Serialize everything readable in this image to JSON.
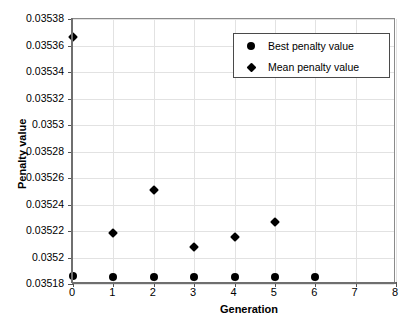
{
  "chart_data": {
    "type": "scatter",
    "title": "",
    "xlabel": "Generation",
    "ylabel": "Penalty value",
    "xlim": [
      0,
      8
    ],
    "ylim": [
      0.03518,
      0.03538
    ],
    "grid": true,
    "legend_position": "upper right",
    "xticks": [
      "0",
      "1",
      "2",
      "3",
      "4",
      "5",
      "6",
      "7",
      "8"
    ],
    "xtick_values": [
      0,
      1,
      2,
      3,
      4,
      5,
      6,
      7,
      8
    ],
    "yticks": [
      "0.03518",
      "0.0352",
      "0.03522",
      "0.03524",
      "0.03526",
      "0.03528",
      "0.0353",
      "0.03532",
      "0.03534",
      "0.03536",
      "0.03538"
    ],
    "ytick_values": [
      0.03518,
      0.0352,
      0.03522,
      0.03524,
      0.03526,
      0.03528,
      0.0353,
      0.03532,
      0.03534,
      0.03536,
      0.03538
    ],
    "series": [
      {
        "name": "Best penalty value",
        "marker": "circle",
        "color": "#000000",
        "x": [
          0,
          1,
          2,
          3,
          4,
          5,
          6
        ],
        "values": [
          0.0351857,
          0.0351855,
          0.0351853,
          0.0351852,
          0.0351851,
          0.035185,
          0.035185
        ]
      },
      {
        "name": "Mean penalty value",
        "marker": "diamond",
        "color": "#000000",
        "x": [
          0,
          1,
          2,
          3,
          4,
          5
        ],
        "values": [
          0.0353665,
          0.0352185,
          0.035251,
          0.035208,
          0.0352155,
          0.0352267
        ]
      }
    ]
  },
  "legend": {
    "items": [
      {
        "label": "Best penalty value",
        "marker": "circle"
      },
      {
        "label": "Mean penalty value",
        "marker": "diamond"
      }
    ]
  }
}
